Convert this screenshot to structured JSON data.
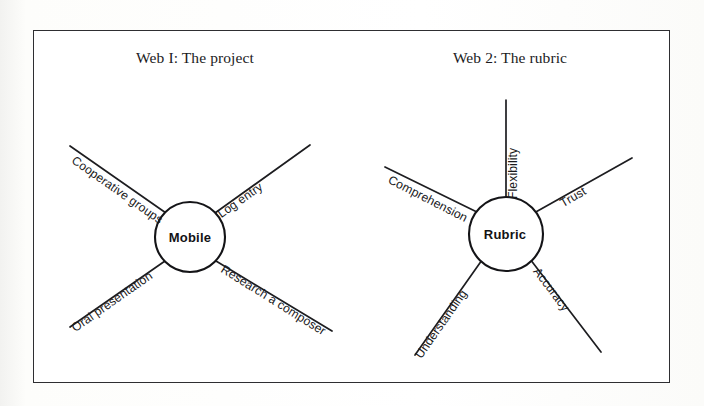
{
  "page": {
    "background_color": "#fdfdfb",
    "frame_color": "#2e2e31"
  },
  "webs": [
    {
      "id": "web-1",
      "title": "Web I: The project",
      "hub": {
        "label": "Mobile",
        "cx": 190,
        "cy": 237,
        "r": 35
      },
      "spokes": [
        {
          "label": "Cooperative groups",
          "x1": 70,
          "y1": 146,
          "x2": 166,
          "y2": 213,
          "label_x": 73,
          "label_y": 152,
          "angle": 35
        },
        {
          "label": "Log entry",
          "x1": 310,
          "y1": 145,
          "x2": 215,
          "y2": 213,
          "label_x": 219,
          "label_y": 208,
          "angle": -35
        },
        {
          "label": "Oral presentation",
          "x1": 70,
          "y1": 327,
          "x2": 165,
          "y2": 261,
          "label_x": 73,
          "label_y": 322,
          "angle": -35
        },
        {
          "label": "Research a composer",
          "x1": 216,
          "y1": 261,
          "x2": 332,
          "y2": 331,
          "label_x": 222,
          "label_y": 261,
          "angle": 32
        }
      ]
    },
    {
      "id": "web-2",
      "title": "Web 2: The rubric",
      "hub": {
        "label": "Rubric",
        "cx": 506,
        "cy": 234,
        "r": 37
      },
      "spokes": [
        {
          "label": "Flexibility",
          "x1": 506,
          "y1": 100,
          "x2": 506,
          "y2": 197,
          "label_x": 513,
          "label_y": 192,
          "angle": -90
        },
        {
          "label": "Comprehension",
          "x1": 385,
          "y1": 167,
          "x2": 481,
          "y2": 214,
          "label_x": 389,
          "label_y": 172,
          "angle": 27
        },
        {
          "label": "Trust",
          "x1": 632,
          "y1": 158,
          "x2": 534,
          "y2": 213,
          "label_x": 561,
          "label_y": 197,
          "angle": -30
        },
        {
          "label": "Understanding",
          "x1": 415,
          "y1": 355,
          "x2": 482,
          "y2": 260,
          "label_x": 418,
          "label_y": 350,
          "angle": -55
        },
        {
          "label": "Accuracy",
          "x1": 530,
          "y1": 259,
          "x2": 601,
          "y2": 352,
          "label_x": 536,
          "label_y": 262,
          "angle": 53
        }
      ]
    }
  ]
}
